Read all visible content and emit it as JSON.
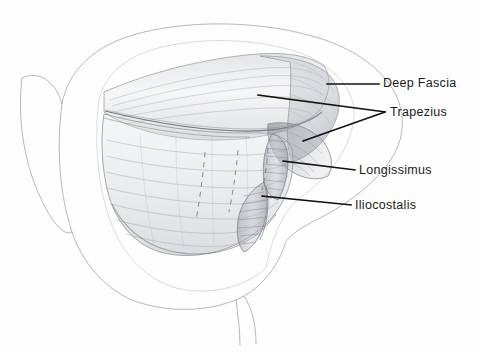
{
  "figure": {
    "type": "anatomical-pencil-drawing",
    "background_color": "#fefefe",
    "ink_color": "#1a1a1a",
    "pencil_color": "#8a8d93"
  },
  "labels": [
    {
      "id": "deep-fascia",
      "text": "Deep  Fascia",
      "leader": {
        "x1": 327,
        "y1": 84,
        "x2": 379,
        "y2": 84
      }
    },
    {
      "id": "trapezius",
      "text": "Trapezius",
      "leader_a": {
        "x1": 258,
        "y1": 95,
        "x2": 385,
        "y2": 112
      },
      "leader_b": {
        "x1": 303,
        "y1": 141,
        "x2": 385,
        "y2": 112
      }
    },
    {
      "id": "longissimus",
      "text": "Longissimus",
      "leader": {
        "x1": 283,
        "y1": 161,
        "x2": 355,
        "y2": 170
      }
    },
    {
      "id": "iliocostalis",
      "text": "Iliocostalis",
      "leader": {
        "x1": 262,
        "y1": 196,
        "x2": 351,
        "y2": 205
      }
    }
  ],
  "drawing_regions": [
    {
      "id": "body-outline",
      "label": "Torso silhouette outline"
    },
    {
      "id": "deep-fascia-sheet",
      "label": "Reflected deep fascia flap"
    },
    {
      "id": "trapezius-flap",
      "label": "Trapezius muscle flap, reflected laterally"
    },
    {
      "id": "longissimus-band",
      "label": "Longissimus muscle column"
    },
    {
      "id": "iliocostalis-band",
      "label": "Iliocostalis muscle column"
    },
    {
      "id": "erector-spinae-mass",
      "label": "Erector spinae muscle mass with striations"
    },
    {
      "id": "dashed-guides",
      "label": "Dashed construction lines over muscle mass"
    }
  ]
}
